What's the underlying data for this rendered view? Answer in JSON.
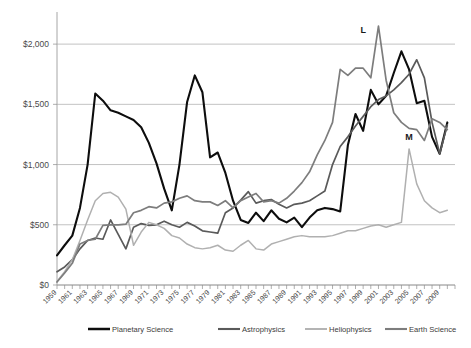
{
  "chart_data": {
    "type": "line",
    "title": "",
    "xlabel": "",
    "ylabel": "",
    "ylim": [
      0,
      2250
    ],
    "xlim": [
      1959,
      2011
    ],
    "grid": true,
    "legend_position": "bottom",
    "ytick_labels": [
      "$0",
      "$500",
      "$1,000",
      "$1,500",
      "$2,000"
    ],
    "ytick_values": [
      0,
      500,
      1000,
      1500,
      2000
    ],
    "xtick_labels": [
      "1959",
      "1961",
      "1963",
      "1965",
      "1967",
      "1969",
      "1971",
      "1973",
      "1975",
      "1977",
      "1979",
      "1981",
      "1983",
      "1985",
      "1987",
      "1989",
      "1991",
      "1993",
      "1995",
      "1997",
      "1999",
      "2001",
      "2003",
      "2005",
      "2007",
      "2009"
    ],
    "x": [
      1959,
      1960,
      1961,
      1962,
      1963,
      1964,
      1965,
      1966,
      1967,
      1968,
      1969,
      1970,
      1971,
      1972,
      1973,
      1974,
      1975,
      1976,
      1977,
      1978,
      1979,
      1980,
      1981,
      1982,
      1983,
      1984,
      1985,
      1986,
      1987,
      1988,
      1989,
      1990,
      1991,
      1992,
      1993,
      1994,
      1995,
      1996,
      1997,
      1998,
      1999,
      2000,
      2001,
      2002,
      2003,
      2004,
      2005,
      2006,
      2007,
      2008,
      2009,
      2010
    ],
    "annotations": [
      {
        "label": "L",
        "x": 1999,
        "y": 2090
      },
      {
        "label": "M",
        "x": 2005,
        "y": 1205
      }
    ],
    "series": [
      {
        "name": "Planetary Science",
        "color": "#0d0d0d",
        "width": 2.1,
        "values": [
          245,
          330,
          410,
          640,
          1000,
          1590,
          1530,
          1450,
          1430,
          1400,
          1370,
          1310,
          1180,
          1010,
          800,
          620,
          1000,
          1520,
          1740,
          1600,
          1060,
          1100,
          930,
          700,
          540,
          515,
          600,
          530,
          620,
          550,
          520,
          560,
          480,
          560,
          620,
          640,
          630,
          610,
          1160,
          1420,
          1280,
          1620,
          1500,
          1570,
          1760,
          1940,
          1790,
          1510,
          1530,
          1230,
          1090,
          1350
        ]
      },
      {
        "name": "Astrophysics",
        "color": "#5a5a5a",
        "width": 1.7,
        "values": [
          110,
          150,
          210,
          300,
          370,
          390,
          380,
          540,
          420,
          300,
          480,
          510,
          495,
          500,
          530,
          500,
          480,
          520,
          490,
          450,
          440,
          430,
          600,
          640,
          705,
          775,
          680,
          700,
          710,
          670,
          640,
          670,
          680,
          700,
          740,
          780,
          1000,
          1150,
          1230,
          1320,
          1400,
          1480,
          1540,
          1570,
          1620,
          1680,
          1750,
          1870,
          1720,
          1350,
          1090,
          1330
        ]
      },
      {
        "name": "Heliophysics",
        "color": "#b0b0b0",
        "width": 1.5,
        "values": [
          30,
          110,
          210,
          370,
          540,
          700,
          760,
          770,
          730,
          630,
          330,
          440,
          520,
          500,
          470,
          410,
          390,
          340,
          310,
          300,
          310,
          330,
          290,
          280,
          330,
          370,
          300,
          290,
          340,
          360,
          380,
          400,
          410,
          400,
          400,
          400,
          410,
          430,
          450,
          450,
          470,
          490,
          500,
          480,
          500,
          520,
          1130,
          840,
          700,
          640,
          600,
          620
        ]
      },
      {
        "name": "Earth Science",
        "color": "#7d7d7d",
        "width": 1.7,
        "values": [
          25,
          100,
          180,
          340,
          370,
          380,
          495,
          500,
          500,
          505,
          600,
          620,
          650,
          640,
          680,
          690,
          720,
          740,
          700,
          690,
          690,
          660,
          700,
          640,
          700,
          730,
          760,
          690,
          700,
          680,
          720,
          780,
          850,
          940,
          1080,
          1200,
          1350,
          1790,
          1740,
          1800,
          1800,
          1720,
          2150,
          1700,
          1430,
          1350,
          1300,
          1290,
          1200,
          1380,
          1350,
          1290
        ]
      }
    ]
  },
  "legend": {
    "items": [
      {
        "label": "Planetary Science"
      },
      {
        "label": "Astrophysics"
      },
      {
        "label": "Heliophysics"
      },
      {
        "label": "Earth Science"
      }
    ]
  }
}
